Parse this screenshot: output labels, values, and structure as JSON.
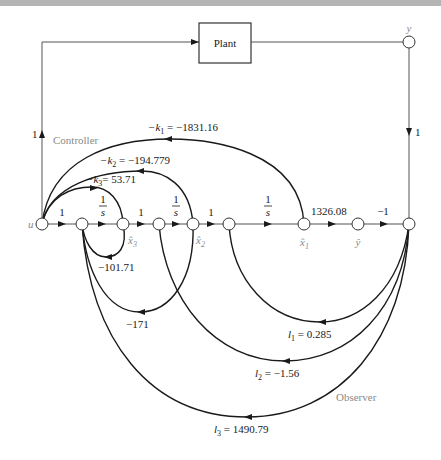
{
  "diagram": {
    "type": "signal-flow-graph",
    "plant_label": "Plant",
    "group_labels": {
      "controller": "Controller",
      "observer": "Observer"
    },
    "nodes": {
      "u": "u",
      "y": "y",
      "x3_hat": "x̂",
      "x3_sub": "3",
      "x2_hat": "x̂",
      "x2_sub": "2",
      "x1_hat": "x̂",
      "x1_sub": "1",
      "y_hat": "ŷ"
    },
    "forward_gains": {
      "u_to_n2": "1",
      "integrator_num": "1",
      "integrator_den": "s",
      "x3_to_n4": "1",
      "x2_to_n6": "1",
      "x1_to_yhat": "1326.08",
      "yhat_to_sum": "−1",
      "left_vertical": "1",
      "right_vertical": "1"
    },
    "controller_gains": {
      "k1_prefix": "−k",
      "k1_sub": "1",
      "k1_value": " = −1831.16",
      "k2_prefix": "−k",
      "k2_sub": "2",
      "k2_value": " = −194.779",
      "k3_prefix": "−k",
      "k3_sub": "3",
      "k3_value": "= 53.71"
    },
    "internal_feedback": {
      "x3_loop": "−101.71",
      "x2_loop": "−171"
    },
    "observer_gains": {
      "l1_prefix": "l",
      "l1_sub": "1",
      "l1_value": " = 0.285",
      "l2_prefix": "l",
      "l2_sub": "2",
      "l2_value": " = −1.56",
      "l3_prefix": "l",
      "l3_sub": "3",
      "l3_value": " = 1490.79"
    }
  }
}
